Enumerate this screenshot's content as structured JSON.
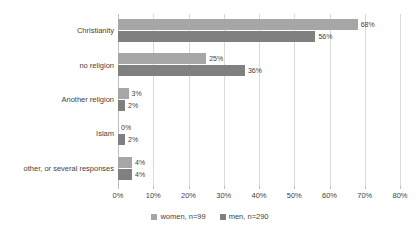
{
  "chart_data": {
    "type": "bar",
    "orientation": "horizontal",
    "title": "",
    "xlabel": "",
    "ylabel": "",
    "categories": [
      "Christianity",
      "no religion",
      "Another religion",
      "Islam",
      "other, or several responses"
    ],
    "series": [
      {
        "name": "women, n=99",
        "color": "#a6a6a6",
        "values": [
          68,
          25,
          3,
          0,
          4
        ],
        "labels": [
          "68%",
          "25%",
          "3%",
          "0%",
          "4%"
        ]
      },
      {
        "name": "men, n=290",
        "color": "#808080",
        "values": [
          56,
          36,
          2,
          2,
          4
        ],
        "labels": [
          "56%",
          "36%",
          "2%",
          "2%",
          "4%"
        ]
      }
    ],
    "xlim": [
      0,
      80
    ],
    "xticks": [
      0,
      10,
      20,
      30,
      40,
      50,
      60,
      70,
      80
    ],
    "xtick_labels": [
      "0%",
      "10%",
      "20%",
      "30%",
      "40%",
      "50%",
      "60%",
      "70%",
      "80%"
    ],
    "grid": true,
    "grid_axis": "x",
    "legend_position": "bottom",
    "legend": [
      "women, n=99",
      "men, n=290"
    ]
  }
}
